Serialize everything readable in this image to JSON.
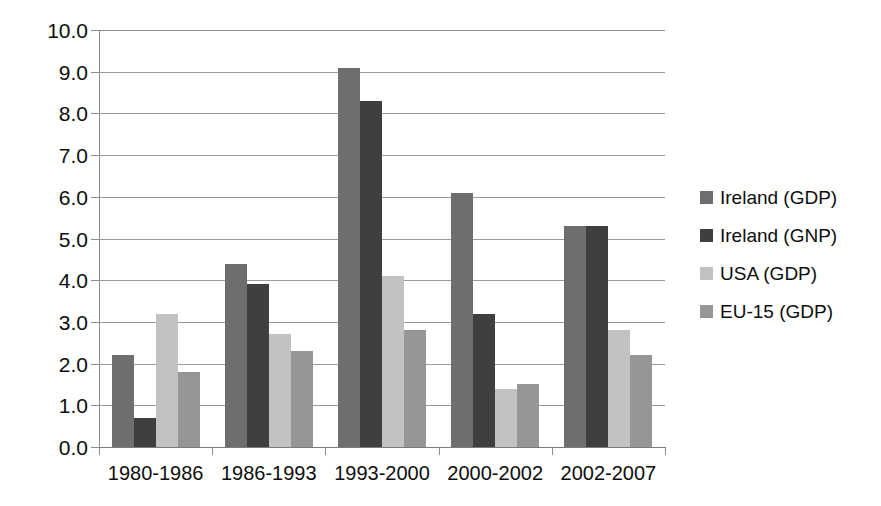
{
  "chart_data": {
    "type": "bar",
    "title": "",
    "subtitle": "",
    "xlabel": "",
    "ylabel": "",
    "categories": [
      "1980-1986",
      "1986-1993",
      "1993-2000",
      "2000-2002",
      "2002-2007"
    ],
    "series": [
      {
        "name": "Ireland (GDP)",
        "color": "#6e6e6e",
        "values": [
          2.2,
          4.4,
          9.1,
          6.1,
          5.3
        ]
      },
      {
        "name": "Ireland (GNP)",
        "color": "#3f3f3f",
        "values": [
          0.7,
          3.9,
          8.3,
          3.2,
          5.3
        ]
      },
      {
        "name": "USA (GDP)",
        "color": "#c2c2c2",
        "values": [
          3.2,
          2.7,
          4.1,
          1.4,
          2.8
        ]
      },
      {
        "name": "EU-15 (GDP)",
        "color": "#969696",
        "values": [
          1.8,
          2.3,
          2.8,
          1.5,
          2.2
        ]
      }
    ],
    "ylim": [
      0,
      10
    ],
    "ytick_step": 1,
    "ytick_labels": [
      "0.0",
      "1.0",
      "2.0",
      "3.0",
      "4.0",
      "5.0",
      "6.0",
      "7.0",
      "8.0",
      "9.0",
      "10.0"
    ],
    "grid": true,
    "grid_color": "#9a9a9a",
    "legend_position": "right",
    "background": "#ffffff"
  }
}
